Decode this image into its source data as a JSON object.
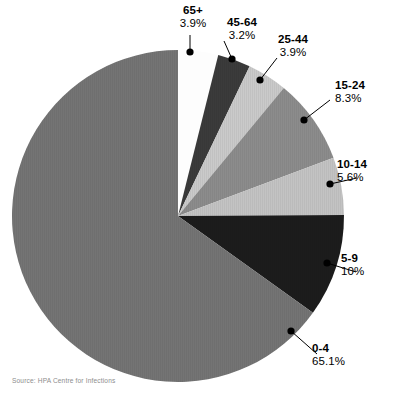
{
  "chart_data": {
    "type": "pie",
    "title": "",
    "subtitle": "",
    "xlabel": "",
    "ylabel": "",
    "legend_position": "none",
    "grid": false,
    "labels_format": "category + percent callouts with leader lines",
    "categories": [
      "0-4",
      "5-9",
      "10-14",
      "15-24",
      "25-44",
      "45-64",
      "65+"
    ],
    "values": [
      65.1,
      10,
      5.6,
      8.3,
      3.9,
      3.2,
      3.9
    ],
    "value_labels": [
      "65.1%",
      "10%",
      "5.6%",
      "8.3%",
      "3.9%",
      "3.2%",
      "3.9%"
    ],
    "units": "percent",
    "slices": [
      {
        "label": "65+",
        "value": 3.9,
        "value_label": "3.9%",
        "color": "#fdfdfd",
        "exploded": true
      },
      {
        "label": "45-64",
        "value": 3.2,
        "value_label": "3.2%",
        "color": "#3b3b3b",
        "exploded": false
      },
      {
        "label": "25-44",
        "value": 3.9,
        "value_label": "3.9%",
        "color": "#cacaca",
        "exploded": false
      },
      {
        "label": "15-24",
        "value": 8.3,
        "value_label": "8.3%",
        "color": "#8c8c8c",
        "exploded": false
      },
      {
        "label": "10-14",
        "value": 5.6,
        "value_label": "5.6%",
        "color": "#c3c3c3",
        "exploded": false
      },
      {
        "label": "5-9",
        "value": 10.0,
        "value_label": "10%",
        "color": "#1c1c1c",
        "exploded": false
      },
      {
        "label": "0-4",
        "value": 65.1,
        "value_label": "65.1%",
        "color": "#747474",
        "exploded": false
      }
    ]
  },
  "callouts": {
    "c65plus": {
      "category": "65+",
      "percent": "3.9%"
    },
    "c4564": {
      "category": "45-64",
      "percent": "3.2%"
    },
    "c2544": {
      "category": "25-44",
      "percent": "3.9%"
    },
    "c1524": {
      "category": "15-24",
      "percent": "8.3%"
    },
    "c1014": {
      "category": "10-14",
      "percent": "5.6%"
    },
    "c59": {
      "category": "5-9",
      "percent": "10%"
    },
    "c04": {
      "category": "0-4",
      "percent": "65.1%"
    }
  },
  "footer": {
    "source": "Source: HPA Centre for Infections"
  },
  "colors": {
    "background": "#ffffff",
    "text": "#000000",
    "source_text": "#8d8d8d",
    "leader": "#000000"
  },
  "geometry": {
    "center_x": 178,
    "center_y": 216,
    "radius": 166,
    "start_angle_deg": -90,
    "direction": "clockwise"
  }
}
